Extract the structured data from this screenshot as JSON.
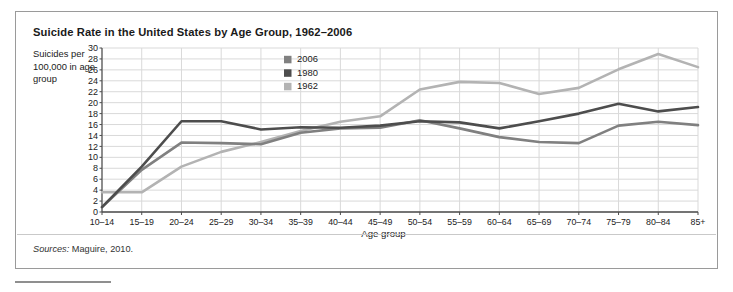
{
  "figure": {
    "title": "Suicide Rate in the United States by Age Group, 1962–2006",
    "y_axis_caption": "Suicides per 100,000 in age group",
    "x_axis_caption": "Age group",
    "sources_label": "Sources:",
    "sources_value": "Maguire, 2010."
  },
  "colors": {
    "series_2006": "#808080",
    "series_1980": "#4d4d4d",
    "series_1962": "#b3b3b3",
    "grid": "#d9d9d9",
    "axis": "#4d4d4d",
    "border": "#9a9a9a",
    "text": "#1a1a1a"
  },
  "chart_data": {
    "type": "line",
    "title": "Suicide Rate in the United States by Age Group, 1962–2006",
    "xlabel": "Age group",
    "ylabel": "Suicides per 100,000 in age group",
    "ylim": [
      0,
      30
    ],
    "ytick_step": 2,
    "yticks": [
      0,
      2,
      4,
      6,
      8,
      10,
      12,
      14,
      16,
      18,
      20,
      22,
      24,
      26,
      28,
      30
    ],
    "grid": true,
    "legend_position": "inside-upper-center-left",
    "categories": [
      "10–14",
      "15–19",
      "20–24",
      "25–29",
      "30–34",
      "35–39",
      "40–44",
      "45–49",
      "50–54",
      "55–59",
      "60–64",
      "65–69",
      "70–74",
      "75–79",
      "80–84",
      "85+"
    ],
    "series": [
      {
        "name": "2006",
        "color": "#808080",
        "values": [
          0.9,
          7.7,
          12.7,
          12.6,
          12.4,
          14.5,
          15.3,
          15.4,
          16.8,
          15.3,
          13.7,
          12.8,
          12.6,
          15.8,
          16.5,
          15.9
        ]
      },
      {
        "name": "1980",
        "color": "#4d4d4d",
        "values": [
          0.9,
          8.3,
          16.6,
          16.6,
          15.1,
          15.5,
          15.4,
          15.8,
          16.6,
          16.4,
          15.3,
          16.6,
          18.0,
          19.8,
          18.4,
          19.2
        ]
      },
      {
        "name": "1962",
        "color": "#b3b3b3",
        "values": [
          3.6,
          3.6,
          8.3,
          11.0,
          12.8,
          14.8,
          16.5,
          17.5,
          22.4,
          23.8,
          23.6,
          21.6,
          22.7,
          26.1,
          28.9,
          26.5
        ]
      }
    ]
  },
  "legend": {
    "entries": [
      {
        "label": "2006",
        "color": "#808080"
      },
      {
        "label": "1980",
        "color": "#4d4d4d"
      },
      {
        "label": "1962",
        "color": "#b3b3b3"
      }
    ]
  }
}
